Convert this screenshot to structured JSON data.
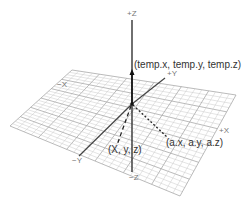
{
  "diagram": {
    "type": "3d-coordinate-system",
    "axis_labels": {
      "pos_z": "+Z",
      "neg_z": "−Z",
      "pos_y": "+Y",
      "neg_y": "−Y",
      "pos_x": "+X",
      "neg_x": "−X"
    },
    "points": {
      "temp": "(temp.x, temp.y, temp.z)",
      "xyz": "(X, y, z)",
      "a": "(a.x, a.y, a.z)"
    },
    "colors": {
      "grid": "#c8c8c8",
      "grid_major": "#a8a8a8",
      "axis": "#333333",
      "label": "#777777",
      "text": "#333333"
    }
  }
}
